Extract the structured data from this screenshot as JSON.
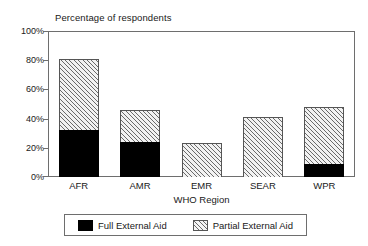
{
  "chart_data": {
    "type": "bar",
    "title": "Percentage of respondents",
    "subtitle": "",
    "xlabel": "WHO Region",
    "ylabel": "",
    "stacked": true,
    "grid": false,
    "legend_position": "bottom",
    "categories": [
      "AFR",
      "AMR",
      "EMR",
      "SEAR",
      "WPR"
    ],
    "ylim": [
      0,
      100
    ],
    "yticks": [
      0,
      20,
      40,
      60,
      80,
      100
    ],
    "ytick_labels": [
      "0%",
      "20%",
      "40%",
      "60%",
      "80%",
      "100%"
    ],
    "series": [
      {
        "name": "Full External Aid",
        "color": "#000000",
        "pattern": "solid",
        "values": [
          32,
          24,
          0,
          0,
          9
        ]
      },
      {
        "name": "Partial External Aid",
        "color": "#f2f2f2",
        "pattern": "diagonal-hatch",
        "values": [
          49,
          22,
          23,
          41,
          39
        ]
      }
    ],
    "totals": [
      81,
      46,
      23,
      41,
      48
    ]
  },
  "legend": {
    "entries": [
      {
        "label": "Full External Aid",
        "swatch": "solid-black-swatch"
      },
      {
        "label": "Partial External Aid",
        "swatch": "hatched-swatch"
      }
    ]
  },
  "colors": {
    "full_aid": "#000000",
    "partial_aid": "#f2f2f2",
    "hatch_line": "#6a6a6a",
    "axis": "#6e6e6e",
    "text": "#202020",
    "background": "#ffffff"
  }
}
